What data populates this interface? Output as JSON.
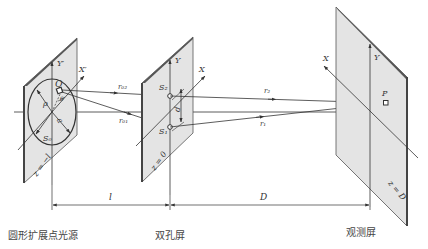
{
  "diagram": {
    "panels": [
      {
        "id": "source",
        "caption": "圆形扩展点光源",
        "plane_label": "z = −l",
        "axes": {
          "x": "X′",
          "y": "Y′"
        },
        "labels": {
          "point": "Q",
          "radius_var": "ρ",
          "radius": "a",
          "area": "S₀",
          "angle": "θ"
        }
      },
      {
        "id": "double-hole",
        "caption": "双孔屏",
        "plane_label": "z = 0",
        "axes": {
          "x": "X",
          "y": "Y"
        },
        "labels": {
          "hole_top": "S₂",
          "hole_bottom": "S₁",
          "separation": "d"
        }
      },
      {
        "id": "observation",
        "caption": "观测屏",
        "plane_label": "z = D",
        "axes": {
          "x": "X",
          "y": "Y"
        },
        "labels": {
          "point": "P"
        }
      }
    ],
    "rays": {
      "r02": "r₀₂",
      "r01": "r₀₁",
      "r2": "r₂",
      "r1": "r₁"
    },
    "dimensions": {
      "source_to_holes": "l",
      "holes_to_screen": "D"
    },
    "colors": {
      "panel_fill": "#e4e4e4",
      "panel_edge": "#555555",
      "line": "#333333"
    }
  }
}
